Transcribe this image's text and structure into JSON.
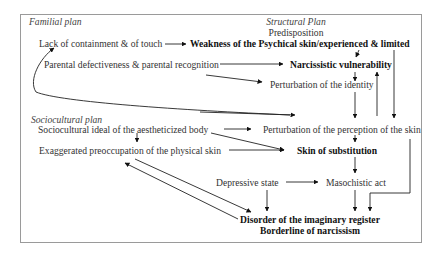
{
  "planes": {
    "familial": "Familial plan",
    "structural": "Structural Plan",
    "sociocultural": "Sociocultural plan"
  },
  "nodes": {
    "predisposition": "Predisposition",
    "lack_containment": "Lack of containment & of touch",
    "weakness_psychical_skin": "Weakness of the Psychical skin/experienced & limited",
    "parental_defectiveness": "Parental defectiveness & parental recognition",
    "narcissistic_vulnerability": "Narcissistic vulnerability",
    "perturbation_identity": "Perturbation of the identity",
    "sociocultural_ideal": "Sociocultural ideal of the aestheticized body",
    "perturbation_perception": "Perturbation of the perception of the skin",
    "exaggerated_preoccupation": "Exaggerated preoccupation of the physical skin",
    "skin_substitution": "Skin of substitution",
    "depressive_state": "Depressive state",
    "masochistic_act": "Masochistic act",
    "disorder_imaginary": "Disorder of the imaginary register",
    "borderline_narcissism": "Borderline of narcissism"
  },
  "edges": [
    {
      "from": "lack_containment",
      "to": "weakness_psychical_skin"
    },
    {
      "from": "weakness_psychical_skin",
      "to": "narcissistic_vulnerability"
    },
    {
      "from": "weakness_psychical_skin",
      "to": "perturbation_perception"
    },
    {
      "from": "parental_defectiveness",
      "to": "narcissistic_vulnerability"
    },
    {
      "from": "parental_defectiveness",
      "to": "perturbation_identity"
    },
    {
      "from": "narcissistic_vulnerability",
      "to": "perturbation_identity"
    },
    {
      "from": "perturbation_identity",
      "to": "perturbation_perception"
    },
    {
      "from": "perturbation_perception",
      "to": "narcissistic_vulnerability"
    },
    {
      "from": "perturbation_perception",
      "to": "lack_containment"
    },
    {
      "from": "sociocultural_ideal",
      "to": "perturbation_perception"
    },
    {
      "from": "sociocultural_ideal",
      "to": "skin_substitution"
    },
    {
      "from": "sociocultural_ideal",
      "to": "exaggerated_preoccupation"
    },
    {
      "from": "exaggerated_preoccupation",
      "to": "skin_substitution"
    },
    {
      "from": "perturbation_perception",
      "to": "skin_substitution"
    },
    {
      "from": "skin_substitution",
      "to": "masochistic_act"
    },
    {
      "from": "depressive_state",
      "to": "masochistic_act"
    },
    {
      "from": "depressive_state",
      "to": "disorder_imaginary"
    },
    {
      "from": "masochistic_act",
      "to": "disorder_imaginary"
    },
    {
      "from": "perturbation_perception",
      "to": "disorder_imaginary"
    },
    {
      "from": "exaggerated_preoccupation",
      "to": "disorder_imaginary"
    },
    {
      "from": "disorder_imaginary",
      "to": "exaggerated_preoccupation"
    }
  ],
  "colors": {
    "line": "#111111",
    "frame": "#9a9a9a",
    "text": "#333333"
  }
}
